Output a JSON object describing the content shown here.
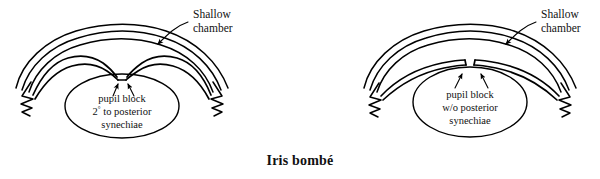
{
  "figure": {
    "caption": "Iris bombé",
    "background_color": "#ffffff",
    "ink_color": "#000000"
  },
  "panels": [
    {
      "id": "left",
      "name": "pupil-block-with-posterior-synechiae",
      "shallow_label_line1": "Shallow",
      "shallow_label_line2": "chamber",
      "block_label_line1": "pupil block",
      "block_label_line2_prefix": "2",
      "block_label_line2_sup": "°",
      "block_label_line2_rest": " to posterior",
      "block_label_line3": "synechiae",
      "arrow_count": 2
    },
    {
      "id": "right",
      "name": "pupil-block-without-posterior-synechiae",
      "shallow_label_line1": "Shallow",
      "shallow_label_line2": "chamber",
      "block_label_line1": "pupil block",
      "block_label_line2": "w/o posterior",
      "block_label_line3": "synechiae",
      "arrow_count": 2
    }
  ]
}
